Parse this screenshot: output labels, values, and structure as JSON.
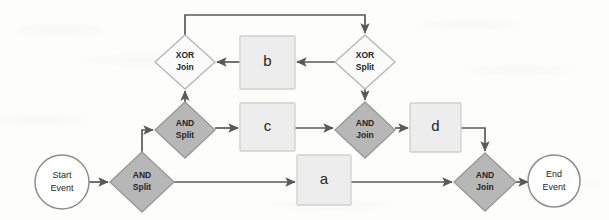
{
  "diagram": {
    "type": "process-flow-diagram",
    "colors": {
      "background": "#fdfdfc",
      "gateway_and_fill": "#b7b7b7",
      "gateway_and_stroke": "#9a9a9a",
      "gateway_xor_fill": "#fbfbfb",
      "gateway_xor_stroke": "#b9b9b9",
      "task_fill": "#ededed",
      "task_stroke": "#cfcfcf",
      "event_fill": "#ffffff",
      "event_stroke": "#8e8e8e",
      "flow_stroke": "#595959",
      "text": "#262626"
    },
    "nodes": [
      {
        "id": "start_event",
        "shape": "circle",
        "kind": "event",
        "label_line1": "Start",
        "label_line2": "Event",
        "cx": 62,
        "cy": 182,
        "rx": 27,
        "ry": 27
      },
      {
        "id": "and_split_1",
        "shape": "diamond",
        "kind": "gateway_and",
        "label_line1": "AND",
        "label_line2": "Split",
        "cx": 142,
        "cy": 182,
        "rx": 32,
        "ry": 30
      },
      {
        "id": "and_split_2",
        "shape": "diamond",
        "kind": "gateway_and",
        "label_line1": "AND",
        "label_line2": "Split",
        "cx": 185,
        "cy": 130,
        "rx": 30,
        "ry": 28
      },
      {
        "id": "xor_join",
        "shape": "diamond",
        "kind": "gateway_xor",
        "label_line1": "XOR",
        "label_line2": "Join",
        "cx": 185,
        "cy": 62,
        "rx": 30,
        "ry": 27
      },
      {
        "id": "xor_split",
        "shape": "diamond",
        "kind": "gateway_xor",
        "label_line1": "XOR",
        "label_line2": "Split",
        "cx": 365,
        "cy": 62,
        "rx": 30,
        "ry": 27
      },
      {
        "id": "and_join_1",
        "shape": "diamond",
        "kind": "gateway_and",
        "label_line1": "AND",
        "label_line2": "Join",
        "cx": 365,
        "cy": 130,
        "rx": 30,
        "ry": 28
      },
      {
        "id": "and_join_2",
        "shape": "diamond",
        "kind": "gateway_and",
        "label_line1": "AND",
        "label_line2": "Join",
        "cx": 485,
        "cy": 182,
        "rx": 31,
        "ry": 29
      },
      {
        "id": "end_event",
        "shape": "circle",
        "kind": "event",
        "label_line1": "End",
        "label_line2": "Event",
        "cx": 554,
        "cy": 181,
        "rx": 26,
        "ry": 26
      },
      {
        "id": "task_b",
        "shape": "rect",
        "kind": "task",
        "label": "b",
        "x": 240,
        "y": 36,
        "w": 55,
        "h": 53
      },
      {
        "id": "task_c",
        "shape": "rect",
        "kind": "task",
        "label": "c",
        "x": 240,
        "y": 103,
        "w": 55,
        "h": 48
      },
      {
        "id": "task_d",
        "shape": "rect",
        "kind": "task",
        "label": "d",
        "x": 410,
        "y": 103,
        "w": 51,
        "h": 49
      },
      {
        "id": "task_a",
        "shape": "rect",
        "kind": "task",
        "label": "a",
        "x": 297,
        "y": 155,
        "w": 54,
        "h": 50
      }
    ],
    "flows": [
      {
        "id": "f1",
        "from": "start_event",
        "to": "and_split_1",
        "points": "89,182 108,182"
      },
      {
        "id": "f2",
        "from": "and_split_1",
        "to": "and_split_2",
        "points": "142,152 142,130 153,130"
      },
      {
        "id": "f3",
        "from": "and_split_1",
        "to": "task_a",
        "points": "174,182 295,182"
      },
      {
        "id": "f4",
        "from": "and_split_2",
        "to": "xor_join",
        "points": "185,102 185,91"
      },
      {
        "id": "f5",
        "from": "and_split_2",
        "to": "task_c",
        "points": "215,128 238,128"
      },
      {
        "id": "f6",
        "from": "xor_join",
        "to": "xor_split",
        "points": "185,35 185,15 365,15 365,33"
      },
      {
        "id": "f7",
        "from": "xor_split",
        "to": "task_b",
        "points": "335,62 297,62"
      },
      {
        "id": "f8",
        "from": "task_b",
        "to": "xor_join",
        "points": "240,62 217,62"
      },
      {
        "id": "f9",
        "from": "xor_split",
        "to": "and_join_1",
        "points": "365,89 365,100"
      },
      {
        "id": "f10",
        "from": "task_c",
        "to": "and_join_1",
        "points": "295,128 333,128"
      },
      {
        "id": "f11",
        "from": "and_join_1",
        "to": "task_d",
        "points": "395,128 408,128"
      },
      {
        "id": "f12",
        "from": "task_d",
        "to": "and_join_2",
        "points": "461,128 485,128 485,151"
      },
      {
        "id": "f13",
        "from": "task_a",
        "to": "and_join_2",
        "points": "351,182 452,182"
      },
      {
        "id": "f14",
        "from": "and_join_2",
        "to": "end_event",
        "points": "516,182 528,182"
      }
    ]
  }
}
